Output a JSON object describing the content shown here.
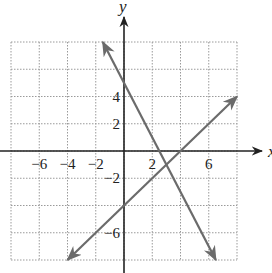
{
  "chart_data": {
    "type": "line",
    "title": "",
    "xlabel": "x",
    "ylabel": "y",
    "xlim": [
      -8,
      8
    ],
    "ylim": [
      -8,
      8
    ],
    "grid": true,
    "grid_step": 2,
    "x_ticks": [
      -6,
      -4,
      -2,
      2,
      6
    ],
    "y_ticks": [
      4,
      2,
      -2,
      -6
    ],
    "series": [
      {
        "name": "y = x - 4",
        "slope": 1,
        "intercept": -4,
        "start": [
          -4,
          -8
        ],
        "end": [
          8,
          4
        ],
        "arrows": "both"
      },
      {
        "name": "y = -2x + 5",
        "slope": -2,
        "intercept": 5,
        "start": [
          -1.5,
          8
        ],
        "end": [
          6.5,
          -8
        ],
        "arrows": "both"
      }
    ],
    "intersection": [
      3,
      -1
    ]
  },
  "labels": {
    "x_axis": "x",
    "y_axis": "y"
  },
  "colors": {
    "axis": "#222222",
    "grid": "#9a9a9a",
    "line": "#6b6b6b"
  }
}
